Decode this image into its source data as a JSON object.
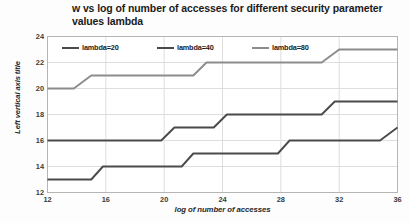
{
  "chart_data": {
    "type": "line",
    "title": "w vs log of number of accesses for different security parameter values lambda",
    "xlabel": "log of number of accesses",
    "ylabel": "Left vertical axis title",
    "xlim": [
      12,
      36
    ],
    "ylim": [
      12,
      24
    ],
    "xticks": [
      12,
      16,
      20,
      24,
      28,
      32,
      36
    ],
    "yticks": [
      12,
      14,
      16,
      18,
      20,
      22,
      24
    ],
    "grid": true,
    "legend_position": "top-inside",
    "series": [
      {
        "name": "lambda=20",
        "color": "#4a4a4a",
        "x": [
          12,
          15,
          15.8,
          21.2,
          22,
          27.8,
          28.6,
          34.8,
          36
        ],
        "values": [
          13,
          13,
          14,
          14,
          15,
          15,
          16,
          16,
          17
        ]
      },
      {
        "name": "lambda=40",
        "color": "#4a4a4a",
        "x": [
          12,
          19.8,
          20.7,
          23.4,
          24.3,
          30.8,
          31.7,
          36
        ],
        "values": [
          16,
          16,
          17,
          17,
          18,
          18,
          19,
          19
        ]
      },
      {
        "name": "lambda=80",
        "color": "#8c8c8c",
        "x": [
          12,
          13.8,
          15,
          22,
          22.9,
          30.8,
          32,
          36
        ],
        "values": [
          20,
          20,
          21,
          21,
          22,
          22,
          23,
          23
        ]
      }
    ]
  },
  "colors": {
    "axis_line": "#b5b5b5",
    "grid_line": "#dedede",
    "plot_background": "#ffffff",
    "title_text": "#1b1b1b",
    "tick_text": "#3a3a3a"
  }
}
